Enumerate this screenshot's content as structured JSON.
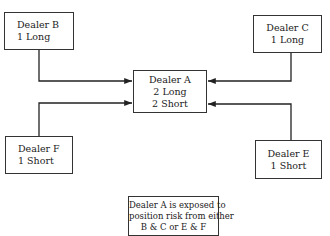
{
  "diagram": {
    "nodes": {
      "dealer_b": {
        "name": "Dealer B",
        "position": "1 Long"
      },
      "dealer_c": {
        "name": "Dealer C",
        "position": "1 Long"
      },
      "dealer_a": {
        "name": "Dealer A",
        "position_long": "2 Long",
        "position_short": "2 Short"
      },
      "dealer_f": {
        "name": "Dealer F",
        "position": "1 Short"
      },
      "dealer_e": {
        "name": "Dealer E",
        "position": "1 Short"
      }
    },
    "edges": [
      {
        "from": "dealer_b",
        "to": "dealer_a"
      },
      {
        "from": "dealer_c",
        "to": "dealer_a"
      },
      {
        "from": "dealer_f",
        "to": "dealer_a"
      },
      {
        "from": "dealer_e",
        "to": "dealer_a"
      }
    ],
    "note": {
      "line1": "Dealer A is exposed to",
      "line2": "position risk from either",
      "line3": "B & C or E & F"
    },
    "colors": {
      "stroke": "#333333",
      "background": "#ffffff",
      "text": "#222222"
    }
  }
}
